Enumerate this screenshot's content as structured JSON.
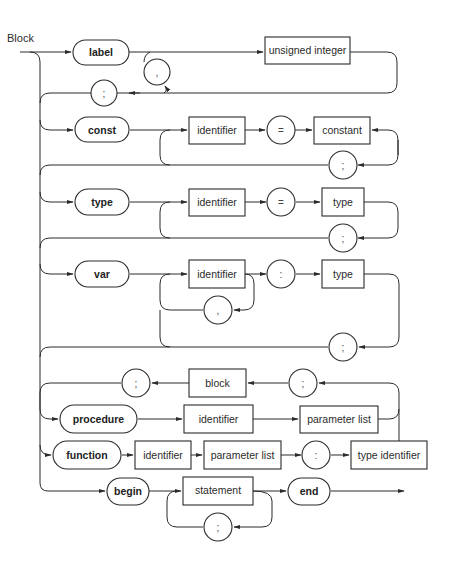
{
  "diagram": {
    "title": "Block",
    "type": "syntax-diagram",
    "rows": [
      {
        "name": "label-section",
        "items": [
          {
            "kind": "keyword",
            "text": "label"
          },
          {
            "kind": "nonterminal",
            "text": "unsigned integer"
          },
          {
            "kind": "symbol",
            "text": ","
          },
          {
            "kind": "symbol",
            "text": ";"
          }
        ]
      },
      {
        "name": "const-section",
        "items": [
          {
            "kind": "keyword",
            "text": "const"
          },
          {
            "kind": "nonterminal",
            "text": "identifier"
          },
          {
            "kind": "symbol",
            "text": "="
          },
          {
            "kind": "nonterminal",
            "text": "constant"
          },
          {
            "kind": "symbol",
            "text": ";"
          }
        ]
      },
      {
        "name": "type-section",
        "items": [
          {
            "kind": "keyword",
            "text": "type"
          },
          {
            "kind": "nonterminal",
            "text": "identifier"
          },
          {
            "kind": "symbol",
            "text": "="
          },
          {
            "kind": "nonterminal",
            "text": "type"
          },
          {
            "kind": "symbol",
            "text": ";"
          }
        ]
      },
      {
        "name": "var-section",
        "items": [
          {
            "kind": "keyword",
            "text": "var"
          },
          {
            "kind": "nonterminal",
            "text": "identifier"
          },
          {
            "kind": "symbol",
            "text": ":"
          },
          {
            "kind": "nonterminal",
            "text": "type"
          },
          {
            "kind": "symbol",
            "text": ","
          },
          {
            "kind": "symbol",
            "text": ";"
          }
        ]
      },
      {
        "name": "block-return",
        "items": [
          {
            "kind": "symbol",
            "text": ";"
          },
          {
            "kind": "nonterminal",
            "text": "block"
          },
          {
            "kind": "symbol",
            "text": ";"
          }
        ]
      },
      {
        "name": "procedure-section",
        "items": [
          {
            "kind": "keyword",
            "text": "procedure"
          },
          {
            "kind": "nonterminal",
            "text": "identifier"
          },
          {
            "kind": "nonterminal",
            "text": "parameter list"
          }
        ]
      },
      {
        "name": "function-section",
        "items": [
          {
            "kind": "keyword",
            "text": "function"
          },
          {
            "kind": "nonterminal",
            "text": "identifier"
          },
          {
            "kind": "nonterminal",
            "text": "parameter list"
          },
          {
            "kind": "symbol",
            "text": ":"
          },
          {
            "kind": "nonterminal",
            "text": "type identifier"
          }
        ]
      },
      {
        "name": "statement-section",
        "items": [
          {
            "kind": "keyword",
            "text": "begin"
          },
          {
            "kind": "nonterminal",
            "text": "statement"
          },
          {
            "kind": "symbol",
            "text": ";"
          },
          {
            "kind": "keyword",
            "text": "end"
          }
        ]
      }
    ]
  }
}
